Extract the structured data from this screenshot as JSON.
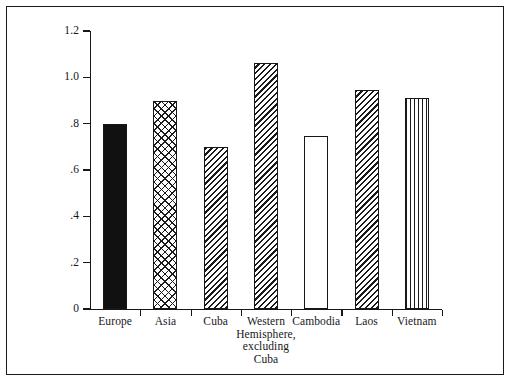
{
  "chart_data": {
    "type": "bar",
    "title": "",
    "subtitle": "",
    "xlabel": "",
    "ylabel": "",
    "categories": [
      "Europe",
      "Asia",
      "Cuba",
      "Western Hemisphere, excluding Cuba",
      "Cambodia",
      "Laos",
      "Vietnam"
    ],
    "values": [
      0.8,
      0.9,
      0.7,
      1.06,
      0.745,
      0.945,
      0.91
    ],
    "ylim": [
      0,
      1.2
    ],
    "ytick_labels": [
      "0",
      ".2",
      ".4",
      ".6",
      ".8",
      "1.0",
      "1.2"
    ],
    "ytick_values": [
      0,
      0.2,
      0.4,
      0.6,
      0.8,
      1.0,
      1.2
    ],
    "grid": false,
    "legend": "none",
    "bar_patterns": [
      "solid-black",
      "crosshatch",
      "diagonal-stripe",
      "diagonal-stripe",
      "blank-white",
      "diagonal-stripe",
      "vertical-stripe"
    ]
  },
  "axis": {
    "y_ticks": [
      {
        "label": "1.2",
        "value": 1.2
      },
      {
        "label": "1.0",
        "value": 1.0
      },
      {
        "label": ".8",
        "value": 0.8
      },
      {
        "label": ".6",
        "value": 0.6
      },
      {
        "label": ".4",
        "value": 0.4
      },
      {
        "label": ".2",
        "value": 0.2
      },
      {
        "label": "0",
        "value": 0
      }
    ]
  },
  "bars": [
    {
      "label": "Europe",
      "label_lines": [
        "Europe"
      ],
      "value": 0.8,
      "pattern": "solid-black"
    },
    {
      "label": "Asia",
      "label_lines": [
        "Asia"
      ],
      "value": 0.9,
      "pattern": "crosshatch"
    },
    {
      "label": "Cuba",
      "label_lines": [
        "Cuba"
      ],
      "value": 0.7,
      "pattern": "diagonal-stripe"
    },
    {
      "label": "Western Hemisphere, excluding Cuba",
      "label_lines": [
        "Western",
        "Hemisphere,",
        "excluding",
        "Cuba"
      ],
      "value": 1.06,
      "pattern": "diagonal-stripe"
    },
    {
      "label": "Cambodia",
      "label_lines": [
        "Cambodia"
      ],
      "value": 0.745,
      "pattern": "blank-white"
    },
    {
      "label": "Laos",
      "label_lines": [
        "Laos"
      ],
      "value": 0.945,
      "pattern": "diagonal-stripe"
    },
    {
      "label": "Vietnam",
      "label_lines": [
        "Vietnam"
      ],
      "value": 0.91,
      "pattern": "vertical-stripe"
    }
  ],
  "colors": {
    "ink": "#171717",
    "background": "#ffffff",
    "bar_solid": "#111111"
  }
}
